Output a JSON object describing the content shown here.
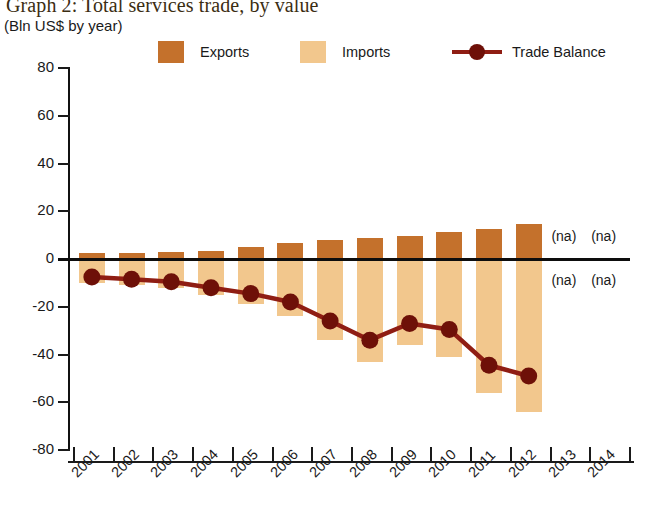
{
  "header": {
    "title": "Graph 2: Total services trade, by value",
    "subtitle": "(Bln US$ by year)"
  },
  "legend": [
    {
      "name": "exports",
      "label": "Exports",
      "type": "swatch",
      "color": "#c4712c"
    },
    {
      "name": "imports",
      "label": "Imports",
      "type": "swatch",
      "color": "#f2c78d"
    },
    {
      "name": "trade-balance",
      "label": "Trade Balance",
      "type": "line",
      "color": "#8f1d13"
    }
  ],
  "annotations": [
    {
      "label": "(na)",
      "year": "2013",
      "position": "above"
    },
    {
      "label": "(na)",
      "year": "2014",
      "position": "above"
    },
    {
      "label": "(na)",
      "year": "2013",
      "position": "below"
    },
    {
      "label": "(na)",
      "year": "2014",
      "position": "below"
    }
  ],
  "chart_data": {
    "type": "bar",
    "title": "Graph 2: Total services trade, by value",
    "subtitle": "(Bln US$ by year)",
    "xlabel": "",
    "ylabel": "Bln US$ by year",
    "ylim": [
      -80,
      80
    ],
    "yticks": [
      80,
      60,
      40,
      20,
      0,
      -20,
      -40,
      -60,
      -80
    ],
    "grid": false,
    "legend_position": "top",
    "categories": [
      "2001",
      "2002",
      "2003",
      "2004",
      "2005",
      "2006",
      "2007",
      "2008",
      "2009",
      "2010",
      "2011",
      "2012",
      "2013",
      "2014"
    ],
    "series": [
      {
        "name": "Exports",
        "type": "bar",
        "color": "#c4712c",
        "values": [
          2.5,
          2.5,
          3,
          3.5,
          5,
          6.5,
          8,
          9,
          9.5,
          11.5,
          12.5,
          14.5,
          null,
          null
        ]
      },
      {
        "name": "Imports",
        "type": "bar",
        "color": "#f2c78d",
        "values": [
          -10,
          -11,
          -12,
          -15,
          -19,
          -24,
          -34,
          -43,
          -36,
          -41,
          -56,
          -64,
          null,
          null
        ]
      },
      {
        "name": "Trade Balance",
        "type": "line",
        "color": "#8f1d13",
        "values": [
          -7.5,
          -8.5,
          -9.5,
          -12,
          -14.5,
          -18,
          -26,
          -34,
          -27,
          -29.5,
          -44.5,
          -49,
          null,
          null
        ]
      }
    ]
  }
}
